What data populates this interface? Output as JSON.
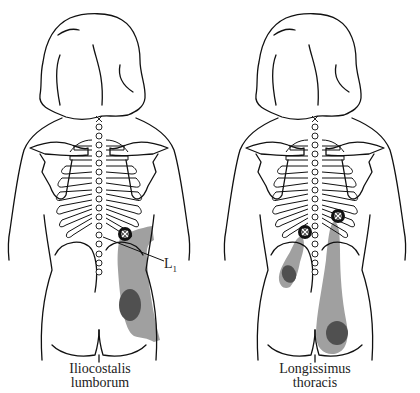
{
  "figures": [
    {
      "muscle": "Iliocostalis lumborum",
      "caption_line1": "Iliocostalis",
      "caption_line2": "lumborum",
      "annotation": {
        "label": "L",
        "subscript": "1"
      },
      "trigger_points": 1
    },
    {
      "muscle": "Longissimus thoracis",
      "caption_line1": "Longissimus",
      "caption_line2": "thoracis",
      "trigger_points": 2
    }
  ],
  "legend": {
    "trigger_point_icon": "circled-x-icon",
    "referred_pain_color": "#a0a0a0",
    "primary_pain_color": "#505050",
    "outline_color": "#111111"
  }
}
